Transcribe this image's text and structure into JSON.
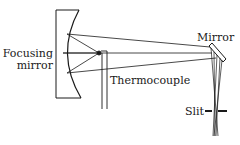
{
  "diagram": {
    "title": "",
    "labels": {
      "focusing_mirror_line1": "Focusing",
      "focusing_mirror_line2": "mirror",
      "mirror": "Mirror",
      "thermocouple": "Thermocouple",
      "slit": "Slit"
    },
    "colors": {
      "stroke": "#1a1a1a",
      "background": "#ffffff"
    }
  }
}
